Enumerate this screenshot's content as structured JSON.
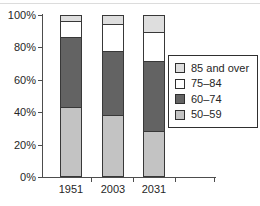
{
  "figure": {
    "background_color": "#ffffff",
    "top_rule_color": "#dcdcdc",
    "axis_color": "#4d4d4d",
    "text_color": "#262626",
    "bar_border_color": "#383838"
  },
  "chart_data": {
    "type": "bar",
    "stacked": true,
    "title": "",
    "xlabel": "",
    "ylabel": "",
    "categories": [
      "1951",
      "2003",
      "2031"
    ],
    "series": [
      {
        "name": "50–59",
        "values": [
          43,
          38,
          28
        ],
        "color": "#c3c3c3"
      },
      {
        "name": "60–74",
        "values": [
          44,
          40,
          44
        ],
        "color": "#636363"
      },
      {
        "name": "75–84",
        "values": [
          10,
          17,
          18
        ],
        "color": "#ffffff"
      },
      {
        "name": "85 and over",
        "values": [
          3,
          5,
          10
        ],
        "color": "#dedede"
      }
    ],
    "ylim": [
      0,
      100
    ],
    "ytick_values": [
      0,
      20,
      40,
      60,
      80,
      100
    ],
    "ytick_labels": [
      "0%",
      "20%",
      "40%",
      "60%",
      "80%",
      "100%"
    ],
    "grid": false,
    "legend": {
      "position": "right",
      "entries": [
        "85 and over",
        "75–84",
        "60–74",
        "50–59"
      ]
    }
  }
}
